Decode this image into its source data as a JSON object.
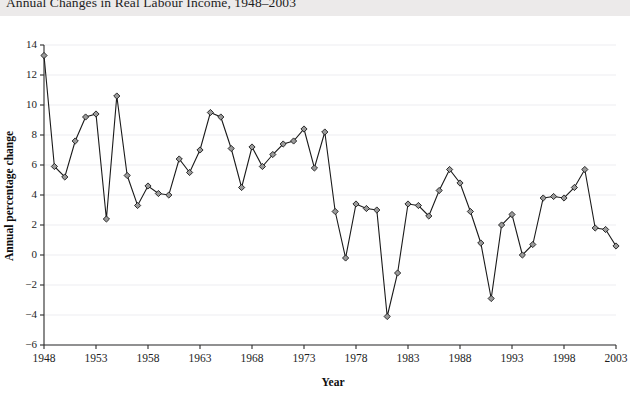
{
  "header": {
    "title": "Annual Changes in Real Labour Income, 1948–2003"
  },
  "colors": {
    "title_band": "#eceaea",
    "line": "#1a1a1a",
    "marker_fill": "#9a9a9a",
    "marker_stroke": "#1a1a1a",
    "grid": "#ededf1",
    "axis": "#2b2b2b",
    "background": "#ffffff"
  },
  "chart_data": {
    "type": "line",
    "title": "Annual Changes in Real Labour Income, 1948–2003",
    "xlabel": "Year",
    "ylabel": "Annual percentage change",
    "xlim": [
      1948,
      2003
    ],
    "ylim": [
      -6,
      14
    ],
    "grid": true,
    "legend": "none",
    "marker": "diamond",
    "ytick_values": [
      -6,
      -4,
      -2,
      0,
      2,
      4,
      6,
      8,
      10,
      12,
      14
    ],
    "ytick_labels": [
      "−6",
      "−4",
      "−2",
      "0",
      "2",
      "4",
      "6",
      "8",
      "10",
      "12",
      "14"
    ],
    "xtick_values": [
      1948,
      1953,
      1958,
      1963,
      1968,
      1973,
      1978,
      1983,
      1988,
      1993,
      1998,
      2003
    ],
    "xtick_labels": [
      "1948",
      "1953",
      "1958",
      "1963",
      "1968",
      "1973",
      "1978",
      "1983",
      "1988",
      "1993",
      "1998",
      "2003"
    ],
    "x": [
      1948,
      1949,
      1950,
      1951,
      1952,
      1953,
      1954,
      1955,
      1956,
      1957,
      1958,
      1959,
      1960,
      1961,
      1962,
      1963,
      1964,
      1965,
      1966,
      1967,
      1968,
      1969,
      1970,
      1971,
      1972,
      1973,
      1974,
      1975,
      1976,
      1977,
      1978,
      1979,
      1980,
      1981,
      1982,
      1983,
      1984,
      1985,
      1986,
      1987,
      1988,
      1989,
      1990,
      1991,
      1992,
      1993,
      1994,
      1995,
      1996,
      1997,
      1998,
      1999,
      2000,
      2001,
      2002,
      2003
    ],
    "y": [
      13.3,
      5.9,
      5.2,
      7.6,
      9.2,
      9.4,
      2.4,
      10.6,
      5.3,
      3.3,
      4.6,
      4.1,
      4.0,
      6.4,
      5.5,
      7.0,
      9.5,
      9.2,
      7.1,
      4.5,
      7.2,
      5.9,
      6.7,
      7.4,
      7.6,
      8.4,
      5.8,
      8.2,
      2.9,
      -0.2,
      3.4,
      3.1,
      3.0,
      -4.1,
      -1.2,
      3.4,
      3.3,
      2.6,
      4.3,
      5.7,
      4.8,
      2.9,
      0.8,
      -2.9,
      2.0,
      2.7,
      0.0,
      0.7,
      3.8,
      3.9,
      3.8,
      4.5,
      5.7,
      1.8,
      1.7,
      0.6
    ],
    "series": [
      {
        "name": "Annual percentage change in real labour income",
        "values": [
          13.3,
          5.9,
          5.2,
          7.6,
          9.2,
          9.4,
          2.4,
          10.6,
          5.3,
          3.3,
          4.6,
          4.1,
          4.0,
          6.4,
          5.5,
          7.0,
          9.5,
          9.2,
          7.1,
          4.5,
          7.2,
          5.9,
          6.7,
          7.4,
          7.6,
          8.4,
          5.8,
          8.2,
          2.9,
          -0.2,
          3.4,
          3.1,
          3.0,
          -4.1,
          -1.2,
          3.4,
          3.3,
          2.6,
          4.3,
          5.7,
          4.8,
          2.9,
          0.8,
          -2.9,
          2.0,
          2.7,
          0.0,
          0.7,
          3.8,
          3.9,
          3.8,
          4.5,
          5.7,
          1.8,
          1.7,
          0.6
        ]
      }
    ]
  }
}
